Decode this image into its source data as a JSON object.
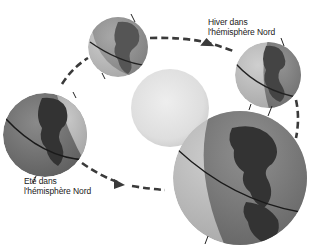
{
  "diagram": {
    "type": "earth-seasons-orbit",
    "labels": {
      "winter": {
        "line1": "Hiver dans",
        "line2": "l'hémisphère Nord"
      },
      "summer": {
        "line1": "Eté dans",
        "line2": "l'hémisphère Nord"
      }
    },
    "sun": {
      "name": "Soleil",
      "color": "#e4e4e4"
    },
    "earth_positions": [
      {
        "id": "top",
        "cx": 118,
        "cy": 47,
        "r": 30
      },
      {
        "id": "right",
        "cx": 268,
        "cy": 75,
        "r": 33
      },
      {
        "id": "left",
        "cx": 45,
        "cy": 135,
        "r": 42
      },
      {
        "id": "bottom-right",
        "cx": 240,
        "cy": 178,
        "r": 67
      }
    ],
    "orbit": {
      "style": "dashed",
      "color": "#3a3a3a",
      "direction": "counterclockwise"
    },
    "colors": {
      "ocean_lit": "#b8b8b8",
      "ocean_dark": "#6e6e6e",
      "land_dark": "#3c3c3c",
      "land_lit": "#8a8a8a",
      "equator": "#222222"
    }
  }
}
